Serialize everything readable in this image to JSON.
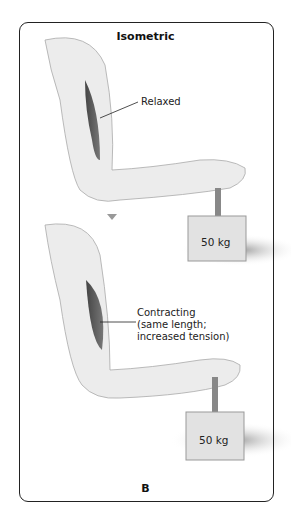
{
  "figure": {
    "title": "Isometric",
    "panel_label": "B",
    "top": {
      "label": "Relaxed",
      "weight": "50 kg"
    },
    "bottom": {
      "label_lines": [
        "Contracting",
        "(same length;",
        "increased tension)"
      ],
      "weight": "50 kg"
    },
    "arrow": "down-arrow"
  }
}
